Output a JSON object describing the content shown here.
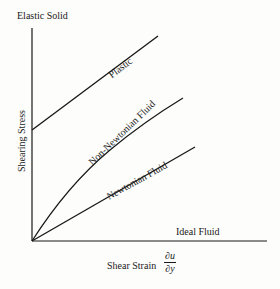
{
  "diagram": {
    "type": "rheology-flow-curves",
    "axes": {
      "x_label_text": "Shear Strain",
      "x_label_fraction": {
        "numerator": "∂u",
        "denominator": "∂y"
      },
      "y_label": "Shearing Stress",
      "y_top_label": "Elastic Solid",
      "x_right_label": "Ideal Fluid"
    },
    "curves": [
      {
        "name": "Plastic",
        "shape": "straight line with yield stress intercept",
        "label": "Plastic"
      },
      {
        "name": "Non-Newtonian Fluid",
        "shape": "concave-down curve from origin",
        "label": "Non-Newtonian Fluid"
      },
      {
        "name": "Newtonian Fluid",
        "shape": "straight line through origin",
        "label": "Newtonian Fluid"
      }
    ],
    "colors": {
      "line": "#1a1a1a",
      "background": "#fdfdfb"
    }
  }
}
